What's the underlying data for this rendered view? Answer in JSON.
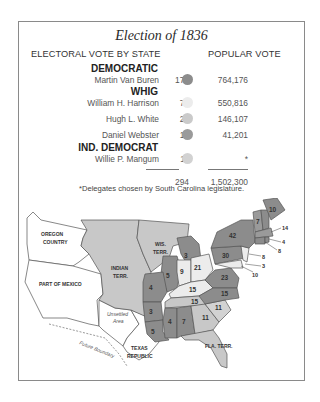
{
  "title": "Election of 1836",
  "headers": {
    "electoral": "ELECTORAL VOTE BY STATE",
    "popular": "POPULAR VOTE"
  },
  "colors": {
    "van_buren": "#8c8c8c",
    "harrison": "#e6e6e6",
    "white": "#c8c8c8",
    "webster": "#9a9a9a",
    "mangum": "#cfcfcf",
    "frame": "#8a8a8a"
  },
  "parties": [
    {
      "name": "DEMOCRATIC",
      "candidates": [
        {
          "name": "Martin Van Buren",
          "electoral": "170",
          "popular": "764,176"
        }
      ]
    },
    {
      "name": "WHIG",
      "candidates": [
        {
          "name": "William H. Harrison",
          "electoral": "73",
          "popular": "550,816"
        },
        {
          "name": "Hugh L. White",
          "electoral": "26",
          "popular": "146,107"
        },
        {
          "name": "Daniel Webster",
          "electoral": "14",
          "popular": "41,201"
        }
      ]
    },
    {
      "name": "IND. DEMOCRAT",
      "candidates": [
        {
          "name": "Willie P. Mangum",
          "electoral": "11",
          "popular": "*"
        }
      ]
    }
  ],
  "totals": {
    "electoral": "294",
    "popular": "1,502,300"
  },
  "footnote": "*Delegates chosen by South Carolina legislature.",
  "map": {
    "regions": {
      "oregon": "OREGON COUNTRY",
      "oregon_l1": "OREGON",
      "oregon_l2": "COUNTRY",
      "mexico": "PART OF MEXICO",
      "indian_l1": "INDIAN",
      "indian_l2": "TERR.",
      "wis_l1": "WIS.",
      "wis_l2": "TERR.",
      "unsettled_l1": "Unsettled",
      "unsettled_l2": "Area",
      "texas_l1": "TEXAS",
      "texas_l2": "REPUBLIC",
      "future_boundary": "Future Boundary",
      "fla_l1": "FLA. TERR."
    },
    "state_votes": {
      "me": "10",
      "nh": "7",
      "vt": "7",
      "ma": "14",
      "ri": "4",
      "ct": "8",
      "ny": "42",
      "nj": "8",
      "pa": "30",
      "de": "3",
      "md": "10",
      "mi": "3",
      "oh": "21",
      "in": "9",
      "il": "5",
      "mo": "4",
      "ky": "15",
      "tn": "15",
      "va": "23",
      "nc": "15",
      "sc": "11",
      "ga": "11",
      "ar": "3",
      "la": "5",
      "ms": "4",
      "al": "7"
    }
  }
}
